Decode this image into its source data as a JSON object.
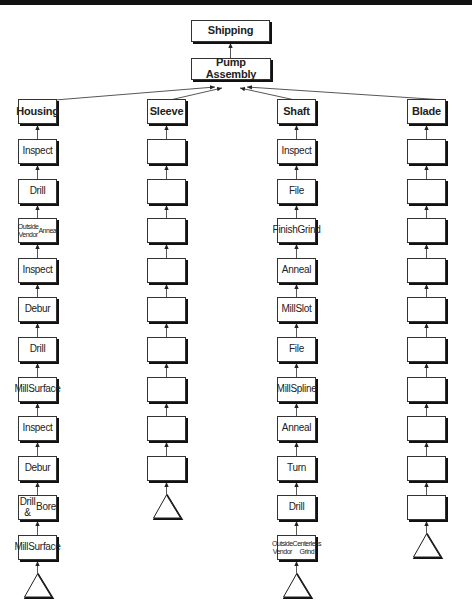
{
  "top": {
    "shipping": "Shipping",
    "assembly": "Pump Assembly"
  },
  "columns": [
    {
      "name": "Housing",
      "steps": [
        "Inspect",
        "Drill",
        "Outside Vendor Anneal",
        "Inspect",
        "Debur",
        "Drill",
        "Mill Surface",
        "Inspect",
        "Debur",
        "Drill & Bore",
        "Mill Surface"
      ],
      "start": "triangle"
    },
    {
      "name": "Sleeve",
      "steps": [
        "",
        "",
        "",
        "",
        "",
        "",
        "",
        "",
        ""
      ],
      "start": "triangle"
    },
    {
      "name": "Shaft",
      "steps": [
        "Inspect",
        "File",
        "Finish Grind",
        "Anneal",
        "Mill Slot",
        "File",
        "Mill Spline",
        "Anneal",
        "Turn",
        "Drill",
        "Centerless Grind"
      ],
      "start": "triangle"
    },
    {
      "name": "Blade",
      "steps": [
        "",
        "",
        "",
        "",
        "",
        "",
        "",
        "",
        "",
        ""
      ],
      "start": "triangle"
    }
  ],
  "colors": {
    "line": "#333333",
    "shadow": "#111111",
    "background": "#ffffff",
    "topbar": "#111111"
  }
}
